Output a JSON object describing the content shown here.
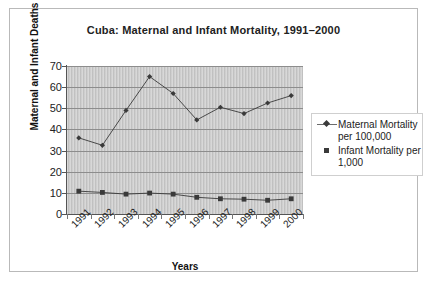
{
  "chart_data": {
    "type": "line",
    "title": "Cuba: Maternal and Infant Mortality, 1991–2000",
    "xlabel": "Years",
    "ylabel": "Maternal and Infant Deaths",
    "categories": [
      "1991",
      "1992",
      "1993",
      "1994",
      "1995",
      "1996",
      "1997",
      "1998",
      "1999",
      "2000"
    ],
    "ylim": [
      0,
      70
    ],
    "ytick_step": 10,
    "yticks": [
      "70",
      "60",
      "50",
      "40",
      "30",
      "20",
      "10",
      "0"
    ],
    "grid": "horizontal",
    "legend_position": "right",
    "series": [
      {
        "name": "Maternal Mortality per 100,000",
        "marker": "diamond",
        "color": "#3a3a3a",
        "values": [
          36,
          32.5,
          49,
          65,
          57,
          44.5,
          50.5,
          47.5,
          52.5,
          56
        ]
      },
      {
        "name": "Infant Mortality per 1,000",
        "marker": "square",
        "color": "#3a3a3a",
        "values": [
          10.8,
          10.2,
          9.4,
          9.9,
          9.4,
          7.9,
          7.2,
          7.0,
          6.5,
          7.2
        ]
      }
    ]
  },
  "legend": {
    "entries": [
      {
        "label_line1": "Maternal Mortality",
        "label_line2": "per 100,000",
        "marker": "diamond-marker-icon"
      },
      {
        "label_line1": "Infant Mortality per",
        "label_line2": "1,000",
        "marker": "square-marker-icon"
      }
    ]
  },
  "colors": {
    "plot_background": "#c9c9c9",
    "gridline": "#8d8d8d",
    "axis": "#555555",
    "series": "#3a3a3a",
    "frame_border": "#b9b9b9",
    "page_background": "#ffffff"
  }
}
